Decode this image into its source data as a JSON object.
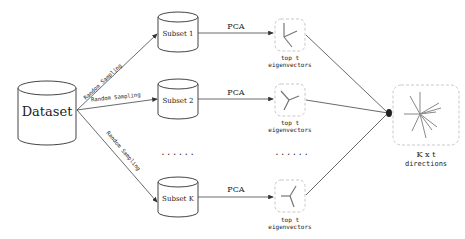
{
  "dataset": {
    "label": "Dataset"
  },
  "sampling_label": "Random Sampling",
  "subsets": [
    {
      "label": "Subset 1",
      "pca_label": "PCA",
      "eig_label_line1": "top t",
      "eig_label_line2": "eigenvectors"
    },
    {
      "label": "Subset 2",
      "pca_label": "PCA",
      "eig_label_line1": "top t",
      "eig_label_line2": "eigenvectors"
    },
    {
      "label": "Subset K",
      "pca_label": "PCA",
      "eig_label_line1": "top t",
      "eig_label_line2": "eigenvectors"
    }
  ],
  "ellipsis": {
    "left": "......",
    "right": "......"
  },
  "result": {
    "line1": "K x t",
    "line2": "directions"
  },
  "colors": {
    "stroke": "#333333",
    "dashed": "#bbbbbb",
    "glyph": "#777777"
  }
}
